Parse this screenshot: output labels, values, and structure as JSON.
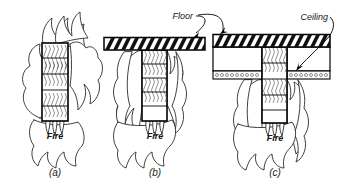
{
  "figure": {
    "background_color": "#ffffff",
    "line_color": "#000000",
    "flame_fill": "#ffffff",
    "hatch_color": "#111111"
  },
  "labels": {
    "floor": "Floor",
    "ceiling": "Ceiling",
    "fire_a": "Fire",
    "fire_b": "Fire",
    "fire_c": "Fire"
  },
  "captions": {
    "a": "(a)",
    "b": "(b)",
    "c": "(c)"
  },
  "panels": [
    {
      "id": "a",
      "caption": "(a)",
      "description": "Timber column fully surrounded by fire on all sides",
      "fire_label": "Fire",
      "has_floor": false,
      "has_ceiling": false,
      "column": {
        "material": "timber",
        "texture": "wood-grain",
        "segments": 5
      }
    },
    {
      "id": "b",
      "caption": "(b)",
      "description": "Timber column supporting a floor slab, fire below floor",
      "fire_label": "Fire",
      "has_floor": true,
      "has_ceiling": false,
      "floor_label": "Floor",
      "column": {
        "material": "timber",
        "texture": "wood-grain",
        "segments": 5
      }
    },
    {
      "id": "c",
      "caption": "(c)",
      "description": "Timber column penetrating a floor and suspended ceiling assembly, fire below ceiling",
      "fire_label": "Fire",
      "has_floor": true,
      "has_ceiling": true,
      "floor_label": "Floor",
      "ceiling_label": "Ceiling",
      "column": {
        "material": "timber",
        "texture": "wood-grain",
        "segments": 5
      }
    }
  ]
}
